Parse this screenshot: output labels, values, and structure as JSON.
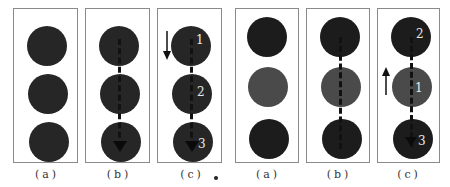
{
  "figure": {
    "colors": {
      "dark": "#242424",
      "darker": "#1c1c1c",
      "medium": "#4a4a4a",
      "border": "#8a8a8a"
    },
    "left_group": {
      "panels": [
        {
          "caption": "(a)",
          "numbers": []
        },
        {
          "caption": "(b)",
          "numbers": []
        },
        {
          "caption": "(c)",
          "numbers": [
            "1",
            "2",
            "3"
          ],
          "direction": "down"
        }
      ]
    },
    "right_group": {
      "panels": [
        {
          "caption": "(a)",
          "numbers": []
        },
        {
          "caption": "(b)",
          "numbers": []
        },
        {
          "caption": "(c)",
          "numbers": [
            "2",
            "1",
            "3"
          ],
          "direction": "up"
        }
      ]
    }
  }
}
